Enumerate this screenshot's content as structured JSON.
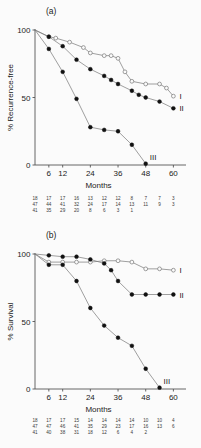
{
  "figure": {
    "background": "#fbfbfb",
    "panels": [
      {
        "panel_label": "(a)",
        "ylabel": "% Recurrence-free",
        "xlabel": "Months",
        "yticks": [
          "100",
          "50",
          "0"
        ],
        "xticks": [
          "6",
          "12",
          "24",
          "36",
          "48",
          "60"
        ],
        "curve_labels": [
          "I",
          "II",
          "III"
        ],
        "risk_table": [
          [
            "18",
            "17",
            "17",
            "16",
            "13",
            "12",
            "12",
            "8",
            "7",
            "7",
            "3"
          ],
          [
            "47",
            "44",
            "41",
            "32",
            "24",
            "17",
            "14",
            "13",
            "11",
            "9",
            "3"
          ],
          [
            "41",
            "35",
            "29",
            "20",
            "8",
            "6",
            "3",
            "1"
          ]
        ]
      },
      {
        "panel_label": "(b)",
        "ylabel": "% Survival",
        "xlabel": "Months",
        "yticks": [
          "100",
          "50",
          "0"
        ],
        "xticks": [
          "6",
          "12",
          "24",
          "36",
          "48",
          "60"
        ],
        "curve_labels": [
          "I",
          "II",
          "III"
        ],
        "risk_table": [
          [
            "18",
            "17",
            "17",
            "15",
            "14",
            "14",
            "14",
            "14",
            "10",
            "10",
            "4"
          ],
          [
            "47",
            "47",
            "46",
            "41",
            "35",
            "29",
            "23",
            "17",
            "16",
            "13",
            "6"
          ],
          [
            "41",
            "40",
            "38",
            "31",
            "18",
            "12",
            "6",
            "4",
            "2"
          ]
        ]
      }
    ]
  },
  "chart_data": [
    {
      "type": "line",
      "title": "(a)",
      "xlabel": "Months",
      "ylabel": "% Recurrence-free",
      "xlim": [
        0,
        62
      ],
      "ylim": [
        0,
        100
      ],
      "xticks": [
        6,
        12,
        24,
        36,
        48,
        60
      ],
      "yticks": [
        0,
        50,
        100
      ],
      "grid": false,
      "legend": "right-end-labels",
      "marker_legend": {
        "I": "open-circle",
        "II": "filled-circle",
        "III": "filled-circle"
      },
      "risk_table_header": [
        "0",
        "6",
        "12",
        "18",
        "24",
        "30",
        "36",
        "42",
        "48",
        "54",
        "60"
      ],
      "series": [
        {
          "name": "I",
          "marker": "open-circle",
          "x": [
            0,
            6,
            9,
            15,
            21,
            24,
            30,
            33,
            36,
            39,
            42,
            48,
            54,
            57,
            60
          ],
          "y": [
            100,
            95,
            94,
            91,
            87,
            83,
            81,
            81,
            79,
            69,
            62,
            60,
            60,
            57,
            51
          ]
        },
        {
          "name": "II",
          "marker": "filled-circle",
          "x": [
            0,
            6,
            12,
            18,
            24,
            30,
            33,
            36,
            42,
            45,
            48,
            54,
            60
          ],
          "y": [
            100,
            95,
            88,
            78,
            71,
            66,
            63,
            60,
            55,
            52,
            50,
            47,
            42
          ]
        },
        {
          "name": "III",
          "marker": "filled-circle",
          "x": [
            0,
            6,
            12,
            18,
            24,
            30,
            36,
            42,
            48
          ],
          "y": [
            100,
            86,
            69,
            49,
            28,
            26,
            25,
            15,
            1
          ]
        }
      ],
      "risk_table": [
        {
          "series": "I",
          "values": [
            18,
            17,
            17,
            16,
            13,
            12,
            12,
            8,
            7,
            7,
            3
          ]
        },
        {
          "series": "II",
          "values": [
            47,
            44,
            41,
            32,
            24,
            17,
            14,
            13,
            11,
            9,
            3
          ]
        },
        {
          "series": "III",
          "values": [
            41,
            35,
            29,
            20,
            8,
            6,
            3,
            1
          ]
        }
      ]
    },
    {
      "type": "line",
      "title": "(b)",
      "xlabel": "Months",
      "ylabel": "% Survival",
      "xlim": [
        0,
        62
      ],
      "ylim": [
        0,
        100
      ],
      "xticks": [
        6,
        12,
        24,
        36,
        48,
        60
      ],
      "yticks": [
        0,
        50,
        100
      ],
      "grid": false,
      "legend": "right-end-labels",
      "marker_legend": {
        "I": "open-circle",
        "II": "filled-circle",
        "III": "filled-circle"
      },
      "risk_table_header": [
        "0",
        "6",
        "12",
        "18",
        "24",
        "30",
        "36",
        "42",
        "48",
        "54",
        "60"
      ],
      "series": [
        {
          "name": "I",
          "marker": "open-circle",
          "x": [
            0,
            6,
            12,
            18,
            24,
            30,
            36,
            42,
            48,
            54,
            60
          ],
          "y": [
            100,
            94,
            94,
            94,
            94,
            95,
            95,
            94,
            89,
            89,
            88
          ]
        },
        {
          "name": "II",
          "marker": "filled-circle",
          "x": [
            0,
            6,
            12,
            18,
            24,
            30,
            33,
            36,
            42,
            48,
            54,
            60
          ],
          "y": [
            100,
            99,
            98,
            98,
            96,
            93,
            88,
            80,
            70,
            70,
            70,
            70
          ]
        },
        {
          "name": "III",
          "marker": "filled-circle",
          "x": [
            0,
            6,
            12,
            18,
            24,
            30,
            36,
            42,
            48,
            54
          ],
          "y": [
            100,
            92,
            92,
            80,
            60,
            47,
            38,
            32,
            15,
            1
          ]
        }
      ],
      "risk_table": [
        {
          "series": "I",
          "values": [
            18,
            17,
            17,
            15,
            14,
            14,
            14,
            14,
            10,
            10,
            4
          ]
        },
        {
          "series": "II",
          "values": [
            47,
            47,
            46,
            41,
            35,
            29,
            23,
            17,
            16,
            13,
            6
          ]
        },
        {
          "series": "III",
          "values": [
            41,
            40,
            38,
            31,
            18,
            12,
            6,
            4,
            2
          ]
        }
      ]
    }
  ]
}
